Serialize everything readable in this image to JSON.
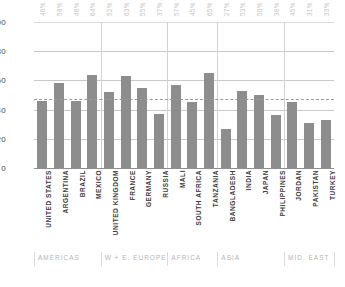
{
  "chart_data": {
    "type": "bar",
    "title": "",
    "xlabel": "",
    "ylabel": "",
    "ylim": [
      0,
      100
    ],
    "yticks": [
      "0",
      "20",
      "40",
      "60",
      "80",
      "100"
    ],
    "grid": true,
    "legend": null,
    "categories": [
      "UNITED STATES",
      "ARGENTINA",
      "BRAZIL",
      "MEXICO",
      "UNITED KINGDOM",
      "FRANCE",
      "GERMANY",
      "RUSSIA",
      "MALI",
      "SOUTH AFRICA",
      "TANZANIA",
      "BANGLADESH",
      "INDIA",
      "JAPAN",
      "PHILIPPINES",
      "JORDAN",
      "PAKISTAN",
      "TURKEY"
    ],
    "values": [
      46,
      58,
      46,
      64,
      52,
      63,
      55,
      37,
      57,
      45,
      65,
      27,
      53,
      50,
      36,
      45,
      31,
      33
    ],
    "value_labels": [
      "46%",
      "58%",
      "46%",
      "64%",
      "52%",
      "63%",
      "55%",
      "37%",
      "57%",
      "45%",
      "65%",
      "27%",
      "53%",
      "50%",
      "36%",
      "45%",
      "31%",
      "33%"
    ],
    "reference_line": {
      "value": 47,
      "style": "dashed"
    },
    "groups": [
      {
        "label": "AMERICAS",
        "start": 0,
        "count": 4
      },
      {
        "label": "W + E. EUROPE",
        "start": 4,
        "count": 4
      },
      {
        "label": "AFRICA",
        "start": 8,
        "count": 3
      },
      {
        "label": "ASIA",
        "start": 11,
        "count": 4
      },
      {
        "label": "MID. EAST",
        "start": 15,
        "count": 3
      }
    ],
    "colors": {
      "bar": "#8d8d8d",
      "grid": "#c9c9c9",
      "reference_line": "#9a9a9a",
      "value_label": "#c4c4c4",
      "category_label": "#3d3d3d",
      "region_label": "#b5b5b5",
      "background": "#ffffff"
    }
  }
}
